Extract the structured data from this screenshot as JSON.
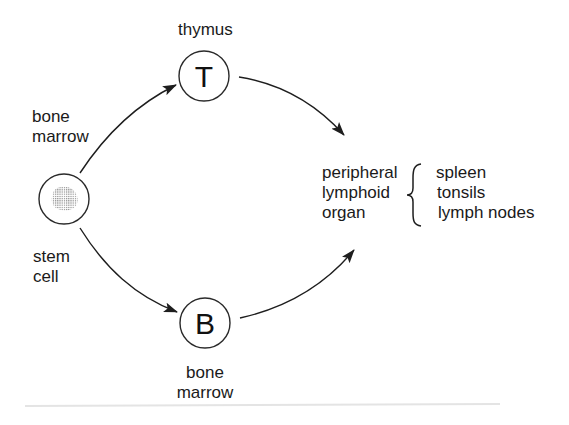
{
  "diagram": {
    "nodes": {
      "stem_cell": {
        "label_lines": [
          "stem",
          "cell"
        ],
        "icon": "stem-cell-icon"
      },
      "t_cell": {
        "letter": "T",
        "label": "thymus"
      },
      "b_cell": {
        "letter": "B",
        "label_lines": [
          "bone",
          "marrow"
        ]
      }
    },
    "edges": {
      "stem_to_t": {
        "label_lines": [
          "bone",
          "marrow"
        ]
      },
      "stem_to_b": {
        "label_lines": []
      },
      "t_to_peripheral": {},
      "b_to_peripheral": {}
    },
    "peripheral": {
      "label_lines": [
        "peripheral",
        "lymphoid",
        "organ"
      ],
      "brace": "{",
      "items": [
        "spleen",
        "tonsils",
        "lymph nodes"
      ]
    }
  },
  "colors": {
    "stroke": "#1e1e1e",
    "text": "#1a1a1a",
    "nucleus": "#9a9a9a",
    "background": "#ffffff"
  }
}
